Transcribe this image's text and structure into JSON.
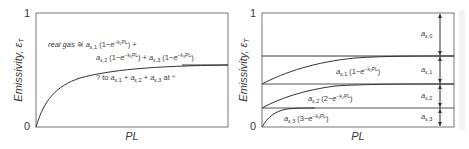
{
  "left_plot": {
    "y_axis_label": "Emissivity, ε",
    "y_axis_sub": "T",
    "y_tick_top": "1",
    "y_tick_bottom": "0",
    "x_axis_label": "PL",
    "annotation_line1": "real gas ≅ a",
    "annotation_line1_terms": "ε,1 (1−e−k1PL) +",
    "annotation_line2": "aε,2 (1−e−k2PL) + aε,3 (1−e−k3PL)",
    "annotation_line3": "? to aε,1 + aε,2 + aε,3 at ∞"
  },
  "right_plot": {
    "y_axis_label": "Emissivity, ε",
    "y_axis_sub": "T",
    "y_tick_top": "1",
    "y_tick_bottom": "0",
    "x_axis_label": "PL",
    "curve_labels": [
      "aε,1 (1−e−k1PL)",
      "aε,2 (2−e−k2PL)",
      "aε,3 (3−e−k3PL)"
    ],
    "band_labels": [
      "aε,0",
      "aε,1",
      "aε,2",
      "aε,3"
    ]
  },
  "colors": {
    "axis": "#555555",
    "curve": "#333333",
    "text": "#3a3a3a"
  }
}
